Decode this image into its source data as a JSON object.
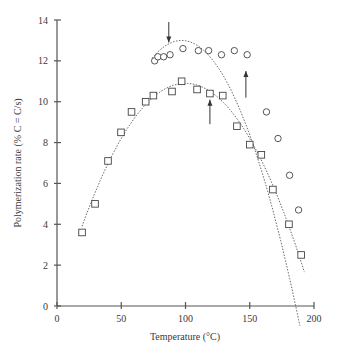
{
  "chart_data": {
    "type": "scatter",
    "title": "",
    "xlabel": "Temperature (°C)",
    "ylabel": "Polymerization rate (% C = C/s)",
    "xlim": [
      0,
      200
    ],
    "ylim": [
      0,
      14
    ],
    "xticks": [
      0,
      50,
      100,
      150,
      200
    ],
    "yticks": [
      0,
      2,
      4,
      6,
      8,
      10,
      12,
      14
    ],
    "grid": false,
    "legend": null,
    "series": [
      {
        "name": "circles",
        "marker": "circle",
        "points": [
          [
            76,
            12.0
          ],
          [
            78.5,
            12.2
          ],
          [
            83,
            12.2
          ],
          [
            88,
            12.3
          ],
          [
            98,
            12.6
          ],
          [
            110,
            12.5
          ],
          [
            118,
            12.5
          ],
          [
            128,
            12.3
          ],
          [
            138,
            12.5
          ],
          [
            148,
            12.3
          ],
          [
            163,
            9.5
          ],
          [
            172,
            8.2
          ],
          [
            181,
            6.4
          ],
          [
            188,
            4.7
          ]
        ],
        "fit_curve": "dashed parabola, peak ~13.0 at ~97 °C"
      },
      {
        "name": "squares",
        "marker": "square",
        "points": [
          [
            19.5,
            3.6
          ],
          [
            29.6,
            5.0
          ],
          [
            39.7,
            7.1
          ],
          [
            49.8,
            8.5
          ],
          [
            58,
            9.5
          ],
          [
            69,
            10.0
          ],
          [
            75,
            10.3
          ],
          [
            89.5,
            10.5
          ],
          [
            97,
            11.0
          ],
          [
            109,
            10.6
          ],
          [
            119,
            10.4
          ],
          [
            129,
            10.3
          ],
          [
            140,
            8.8
          ],
          [
            150,
            7.9
          ],
          [
            159,
            7.4
          ],
          [
            168,
            5.7
          ],
          [
            180.5,
            4.0
          ],
          [
            190,
            2.5
          ]
        ],
        "fit_curve": "dashed parabola, peak ~10.9 at ~100 °C"
      }
    ],
    "annotations": [
      {
        "type": "arrow-down",
        "x": 87,
        "y_from": 13.9,
        "y_to": 12.9
      },
      {
        "type": "arrow-up",
        "x": 119,
        "y_from": 8.9,
        "y_to": 10.1
      },
      {
        "type": "arrow-up",
        "x": 147,
        "y_from": 10.2,
        "y_to": 11.5
      }
    ]
  },
  "axes": {
    "x_tick_labels": [
      "0",
      "50",
      "100",
      "150",
      "200"
    ],
    "y_tick_labels": [
      "0",
      "2",
      "4",
      "6",
      "8",
      "10",
      "12",
      "14"
    ],
    "x_title": "Temperature (°C)",
    "y_title": "Polymerization rate (% C = C/s)"
  }
}
